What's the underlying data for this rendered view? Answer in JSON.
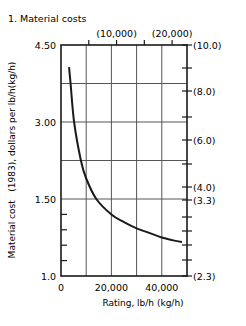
{
  "chart_data": {
    "type": "line",
    "title": "1. Material costs",
    "xlabel": "Rating, lb/h (kg/h)",
    "ylabel": "Material cost   (1983), dollars per lb/h(kg/h)",
    "x_ticks": [
      {
        "value": 0,
        "label": "0"
      },
      {
        "value": 20000,
        "label": "20,000"
      },
      {
        "value": 40000,
        "label": "40,000"
      }
    ],
    "x_grid": [
      10000,
      20000,
      30000,
      40000
    ],
    "xlim": [
      0,
      50000
    ],
    "top_axis": {
      "unit": "kg/h",
      "ticks": [
        {
          "lbh": 11023,
          "label": ""
        },
        {
          "lbh": 22046,
          "label": "(10,000)"
        },
        {
          "lbh": 33069,
          "label": ""
        },
        {
          "lbh": 44092,
          "label": "(20,000)"
        }
      ]
    },
    "y_ticks": [
      {
        "value": 4.5,
        "label": "4.50"
      },
      {
        "value": 3.0,
        "label": "3.00"
      },
      {
        "value": 1.5,
        "label": "1.50"
      },
      {
        "value": 1.0,
        "label": "1.0"
      }
    ],
    "y_grid": [
      3.75,
      3.0,
      2.25,
      1.5
    ],
    "y_minor_ticks": [
      1.4,
      1.3,
      1.2,
      1.1
    ],
    "ylim": [
      1.0,
      4.5
    ],
    "y_axis_note": "broken scale: 1.5-4.5 compressed, 1.0-1.5 expanded",
    "right_axis": {
      "unit": "dollars per kg/h",
      "ticks": [
        {
          "y_px": 45,
          "label": "(10.0)"
        },
        {
          "y_px": 68,
          "label": ""
        },
        {
          "y_px": 91,
          "label": "(8.0)"
        },
        {
          "y_px": 117,
          "label": ""
        },
        {
          "y_px": 140,
          "label": "(6.0)"
        },
        {
          "y_px": 164,
          "label": ""
        },
        {
          "y_px": 187,
          "label": "(4.0)"
        },
        {
          "y_px": 200,
          "label": "(3.3)"
        },
        {
          "y_px": 217,
          "label": ""
        },
        {
          "y_px": 231,
          "label": ""
        },
        {
          "y_px": 245,
          "label": ""
        },
        {
          "y_px": 260,
          "label": ""
        },
        {
          "y_px": 276,
          "label": "(2.3)"
        }
      ]
    },
    "series": [
      {
        "name": "Material cost",
        "x": [
          3200,
          3800,
          5200,
          7900,
          10000,
          14000,
          20000,
          25000,
          30000,
          35000,
          40000,
          45000,
          48000
        ],
        "values": [
          4.07,
          3.75,
          3.0,
          2.25,
          1.9,
          1.5,
          1.4,
          1.35,
          1.31,
          1.28,
          1.25,
          1.23,
          1.22
        ]
      }
    ],
    "grid": true,
    "legend": null
  }
}
